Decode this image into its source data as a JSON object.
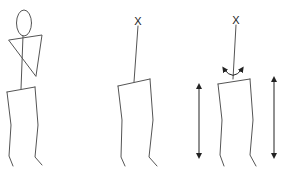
{
  "diagram": {
    "colors": {
      "line": "#555555",
      "mark": "#222222",
      "background": "#ffffff"
    },
    "panels": [
      {
        "id": "full-figure",
        "parts": [
          "head",
          "neck-spine",
          "arms-triangle",
          "pelvis",
          "left-leg",
          "right-leg"
        ]
      },
      {
        "id": "head-marker-figure",
        "marker": "X",
        "parts": [
          "spine-line",
          "pelvis",
          "left-leg",
          "right-leg"
        ]
      },
      {
        "id": "rotation-figure",
        "marker": "X",
        "parts": [
          "spine-line",
          "rotation-arrow",
          "pelvis",
          "left-leg",
          "right-leg",
          "left-vertical-arrow",
          "right-vertical-arrow"
        ]
      }
    ],
    "markers": {
      "panel2": "X",
      "panel3": "X"
    }
  }
}
